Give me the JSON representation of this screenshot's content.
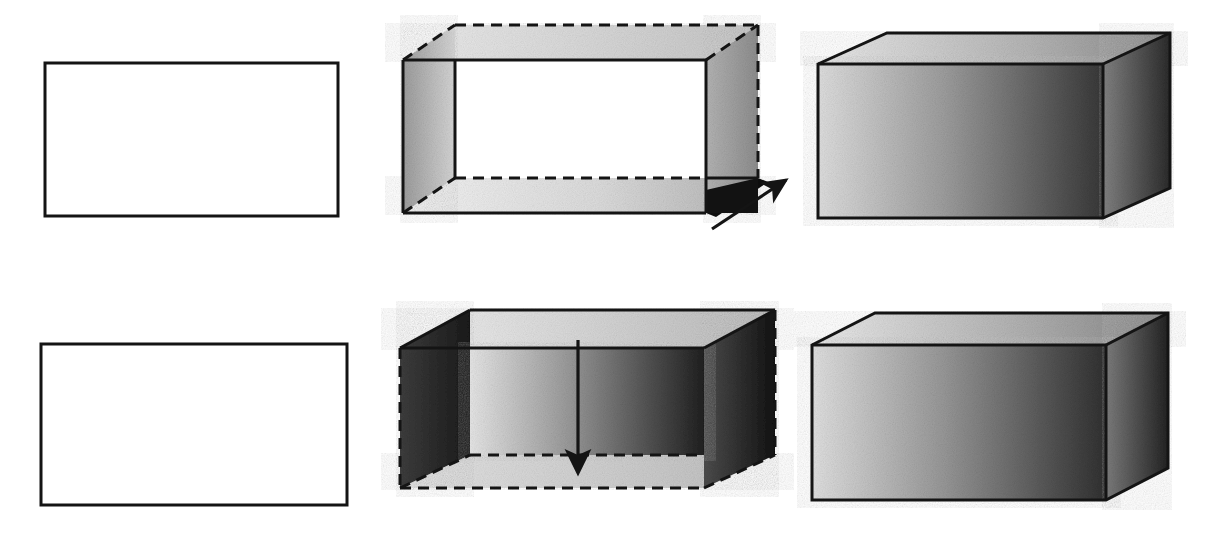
{
  "figure": {
    "type": "technical-illustration",
    "canvas": {
      "width": 1221,
      "height": 539,
      "background": "#ffffff"
    },
    "rows": [
      {
        "id": "row-top",
        "label": "Upward / outward extrusion sequence",
        "direction": "up-right",
        "steps": [
          "profile",
          "extrusion-in-progress",
          "finished-solid"
        ]
      },
      {
        "id": "row-bottom",
        "label": "Downward extrusion sequence",
        "direction": "down",
        "steps": [
          "profile",
          "extrusion-in-progress",
          "finished-solid"
        ]
      }
    ],
    "panels": [
      {
        "id": "top-left-profile",
        "role": "profile",
        "shape": "rectangle",
        "fill": "#ffffff",
        "stroke": "#1a1a1a",
        "stroke_width": 3,
        "rect": {
          "x": 45,
          "y": 63,
          "w": 293,
          "h": 153
        }
      },
      {
        "id": "top-middle-open-box",
        "role": "extrusion-in-progress",
        "shape": "open-box",
        "hidden_edge_style": "dashed",
        "arrow": {
          "name": "extrude-direction-arrow",
          "direction": "up-right",
          "from": [
            712,
            228
          ],
          "to": [
            790,
            178
          ]
        },
        "faces": {
          "left": {
            "name": "left-face",
            "fill_from": "#9a9a9a",
            "fill_to": "#d8d8d8"
          },
          "right": {
            "name": "right-face",
            "fill_from": "#b0b0b0",
            "fill_to": "#8f8f8f"
          },
          "bottom_inner": {
            "name": "inner-bottom-face",
            "fill_from": "#f2f2f2",
            "fill_to": "#b8b8b8"
          },
          "top_inner": {
            "name": "inner-top-face",
            "fill_from": "#eaeaea",
            "fill_to": "#c9c9c9"
          },
          "corner_shadow": {
            "name": "corner-shadow",
            "fill": "#0f0f0f"
          },
          "opening": {
            "name": "open-interior",
            "fill": "#ffffff"
          }
        }
      },
      {
        "id": "top-right-solid",
        "role": "finished-solid",
        "shape": "solid-box",
        "faces": {
          "top": {
            "name": "top-face",
            "fill_from": "#e6e6e6",
            "fill_to": "#8e8e8e"
          },
          "front": {
            "name": "front-face",
            "fill_from": "#d9d9d9",
            "fill_to": "#3b3b3b"
          },
          "right": {
            "name": "right-face",
            "fill_from": "#808080",
            "fill_to": "#2e2e2e"
          }
        }
      },
      {
        "id": "bottom-left-profile",
        "role": "profile",
        "shape": "rectangle",
        "fill": "#ffffff",
        "stroke": "#1a1a1a",
        "stroke_width": 3,
        "rect": {
          "x": 41,
          "y": 344,
          "w": 306,
          "h": 161
        }
      },
      {
        "id": "bottom-middle-open-box",
        "role": "extrusion-in-progress",
        "shape": "open-box",
        "hidden_edge_style": "dashed",
        "arrow": {
          "name": "extrude-direction-arrow",
          "direction": "down",
          "from": [
            578,
            340
          ],
          "to": [
            578,
            478
          ]
        },
        "faces": {
          "top": {
            "name": "top-face",
            "fill_from": "#f0f0f0",
            "fill_to": "#bdbdbd"
          },
          "left": {
            "name": "left-face",
            "fill_from": "#3a3a3a",
            "fill_to": "#1c1c1c"
          },
          "front": {
            "name": "front-face",
            "fill_from": "#e3e3e3",
            "fill_to": "#242424"
          },
          "right": {
            "name": "right-face",
            "fill_from": "#4a4a4a",
            "fill_to": "#151515"
          },
          "bottom_hidden": {
            "name": "hidden-bottom-face",
            "fill_from": "#e0e0e0",
            "fill_to": "#c0c0c0"
          }
        }
      },
      {
        "id": "bottom-right-solid",
        "role": "finished-solid",
        "shape": "solid-box",
        "faces": {
          "top": {
            "name": "top-face",
            "fill_from": "#e8e8e8",
            "fill_to": "#8a8a8a"
          },
          "front": {
            "name": "front-face",
            "fill_from": "#dcdcdc",
            "fill_to": "#333333"
          },
          "right": {
            "name": "right-face",
            "fill_from": "#7a7a7a",
            "fill_to": "#262626"
          }
        }
      }
    ],
    "colors": {
      "outline": "#141414",
      "dashed_outline": "#141414",
      "arrow": "#141414",
      "paper": "#ffffff"
    }
  }
}
